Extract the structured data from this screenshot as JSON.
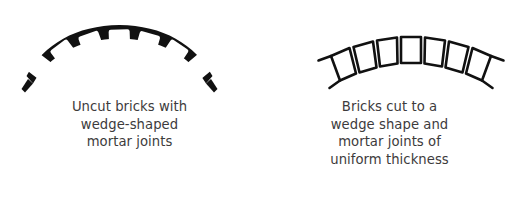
{
  "figure": {
    "background_color": "#ffffff",
    "ink_color": "#111111",
    "text_color": "#3d3b3c"
  },
  "panels": [
    {
      "id": "uncut-bricks",
      "diagram": {
        "name": "arch-uncut-bricks",
        "description": "Masonry arch drawn with seven rectangular uncut bricks separated by thick black wedge-shaped mortar joints",
        "brick_count": 7,
        "brick_shape": "rectangular",
        "joint_shape": "wedge",
        "joint_style": "thick-solid-black",
        "joint_fill": "#111111",
        "brick_fill": "#ffffff"
      },
      "caption": {
        "lines": [
          "Uncut bricks with",
          "wedge-shaped",
          "mortar joints"
        ]
      }
    },
    {
      "id": "cut-bricks",
      "diagram": {
        "name": "arch-cut-bricks",
        "description": "Masonry arch drawn with seven tapered wedge-shaped bricks outlined in thin black line with thin uniform mortar joints",
        "brick_count": 7,
        "brick_shape": "wedge",
        "joint_shape": "uniform",
        "joint_style": "thin-uniform-line",
        "joint_fill": "#111111",
        "brick_fill": "#ffffff"
      },
      "caption": {
        "lines": [
          "Bricks cut to a",
          "wedge shape and",
          "mortar joints of",
          "uniform thickness"
        ]
      }
    }
  ]
}
